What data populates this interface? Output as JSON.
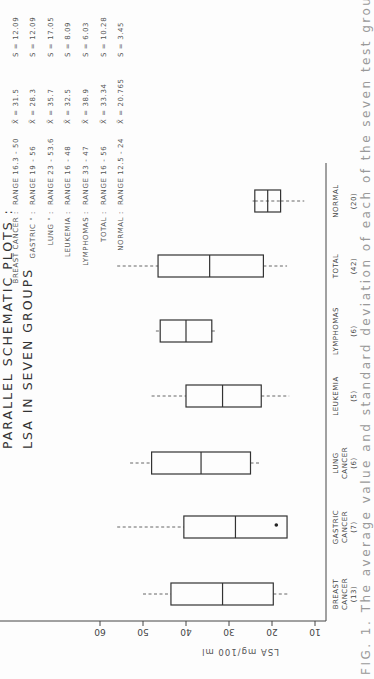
{
  "figure": {
    "orientation": "rotated 90 degrees counterclockwise",
    "title_line1": "PARALLEL   SCHEMATIC   PLOTS :",
    "title_line2": "LSA   IN   SEVEN   GROUPS",
    "caption": "FIG. 1.  The average value and standard deviation of each of the seven test groups are indicated",
    "y_axis_label": "LSA  mg/100 ml",
    "y_ticks": [
      "60",
      "50",
      "40",
      "30",
      "20",
      "10"
    ]
  },
  "stats_table": [
    {
      "group": "BREAST  CANCER :",
      "range": "RANGE  16.3 - 50",
      "mean": "X̄ = 31.5",
      "sd": "S = 12.09"
    },
    {
      "group": "GASTRIC    \"     :",
      "range": "RANGE  19 - 56",
      "mean": "X̄ = 28.3",
      "sd": "S = 12.09"
    },
    {
      "group": "LUNG    \"     :",
      "range": "RANGE  23 - 53.6",
      "mean": "X̄ = 35.7",
      "sd": "S = 17.05"
    },
    {
      "group": "LEUKEMIA :",
      "range": "RANGE  16 - 48",
      "mean": "X̄ = 32.5",
      "sd": "S = 8.09"
    },
    {
      "group": "LYMPHOMAS :",
      "range": "RANGE  33 - 47",
      "mean": "X̄ = 38.9",
      "sd": "S = 6.03"
    },
    {
      "group": "TOTAL :",
      "range": "RANGE  16 - 56",
      "mean": "X̄ = 33.34",
      "sd": "S = 10.28"
    },
    {
      "group": "NORMAL :",
      "range": "RANGE  12.5 - 24",
      "mean": "X̄ = 20.765",
      "sd": "S = 3.45"
    }
  ],
  "categories": [
    {
      "line1": "BREAST",
      "line2": "CANCER",
      "n": "(13)"
    },
    {
      "line1": "GASTRIC",
      "line2": "CANCER",
      "n": "(7)"
    },
    {
      "line1": "LUNG",
      "line2": "CANCER",
      "n": "(6)"
    },
    {
      "line1": "LEUKEMIA",
      "line2": "",
      "n": "(5)"
    },
    {
      "line1": "LYMPHOMAS",
      "line2": "",
      "n": "(6)"
    },
    {
      "line1": "TOTAL",
      "line2": "",
      "n": "(42)"
    },
    {
      "line1": "NORMAL",
      "line2": "",
      "n": "(20)"
    }
  ],
  "chart_data": {
    "type": "boxplot",
    "xlabel": "",
    "ylabel": "LSA mg/100 ml",
    "ylim": [
      10,
      60
    ],
    "y_ticks": [
      10,
      20,
      30,
      40,
      50,
      60
    ],
    "grid": false,
    "categories": [
      "BREAST CANCER (13)",
      "GASTRIC CANCER (7)",
      "LUNG CANCER (6)",
      "LEUKEMIA (5)",
      "LYMPHOMAS (6)",
      "TOTAL (42)",
      "NORMAL (20)"
    ],
    "series": [
      {
        "name": "BREAST CANCER",
        "n": 13,
        "whisker_low": 16,
        "q1": 19.7,
        "median": 31.5,
        "q3": 43.5,
        "whisker_high": 50,
        "outliers": []
      },
      {
        "name": "GASTRIC CANCER",
        "n": 7,
        "whisker_low": 16.5,
        "q1": 16.5,
        "median": 28.5,
        "q3": 40.5,
        "whisker_high": 56,
        "outliers": [
          19
        ]
      },
      {
        "name": "LUNG CANCER",
        "n": 6,
        "whisker_low": 22.5,
        "q1": 25,
        "median": 36.5,
        "q3": 48,
        "whisker_high": 53,
        "outliers": []
      },
      {
        "name": "LEUKEMIA",
        "n": 5,
        "whisker_low": 16,
        "q1": 22.5,
        "median": 31.5,
        "q3": 40,
        "whisker_high": 48,
        "outliers": []
      },
      {
        "name": "LYMPHOMAS",
        "n": 6,
        "whisker_low": 33,
        "q1": 34,
        "median": 40,
        "q3": 46,
        "whisker_high": 47,
        "outliers": []
      },
      {
        "name": "TOTAL",
        "n": 42,
        "whisker_low": 16.5,
        "q1": 22,
        "median": 34.5,
        "q3": 46.5,
        "whisker_high": 56,
        "outliers": []
      },
      {
        "name": "NORMAL",
        "n": 20,
        "whisker_low": 12.5,
        "q1": 18,
        "median": 21,
        "q3": 24,
        "whisker_high": 24.5,
        "outliers": []
      }
    ],
    "summary_stats": [
      {
        "group": "BREAST CANCER",
        "range": [
          16.3,
          50
        ],
        "mean": 31.5,
        "sd": 12.09
      },
      {
        "group": "GASTRIC CANCER",
        "range": [
          19,
          56
        ],
        "mean": 28.3,
        "sd": 12.09
      },
      {
        "group": "LUNG CANCER",
        "range": [
          23,
          53.6
        ],
        "mean": 35.7,
        "sd": 17.05
      },
      {
        "group": "LEUKEMIA",
        "range": [
          16,
          48
        ],
        "mean": 32.5,
        "sd": 8.09
      },
      {
        "group": "LYMPHOMAS",
        "range": [
          33,
          47
        ],
        "mean": 38.9,
        "sd": 6.03
      },
      {
        "group": "TOTAL",
        "range": [
          16,
          56
        ],
        "mean": 33.34,
        "sd": 10.28
      },
      {
        "group": "NORMAL",
        "range": [
          12.5,
          24
        ],
        "mean": 20.765,
        "sd": 3.45
      }
    ]
  }
}
